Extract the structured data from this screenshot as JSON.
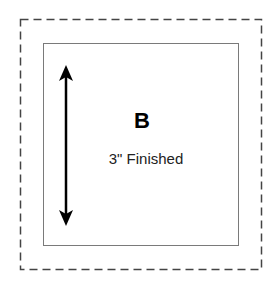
{
  "diagram": {
    "block_label": "B",
    "size_label": "3\" Finished",
    "outer_border": "dashed seam allowance",
    "inner_border": "solid finished edge",
    "arrow": "double-headed vertical dimension arrow",
    "colors": {
      "line": "#000000",
      "inner_border": "#7a7a7a",
      "background": "#ffffff"
    }
  }
}
